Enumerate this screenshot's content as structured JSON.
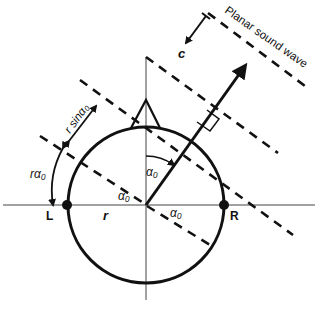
{
  "diagram": {
    "labels": {
      "wave": "Planar sound wave",
      "speed": "c",
      "left_ear": "L",
      "right_ear": "R",
      "radius": "r",
      "arc_length": "rα₀",
      "path_extra": "r sinα₀",
      "angle_upper": "α₀",
      "angle_left": "α₀",
      "angle_right": "α₀"
    },
    "colors": {
      "stroke": "#111111",
      "axis": "#555555",
      "background": "#ffffff"
    },
    "geometry": {
      "center": [
        146,
        205
      ],
      "radius": 78,
      "incidence_angle_deg": 35
    }
  }
}
